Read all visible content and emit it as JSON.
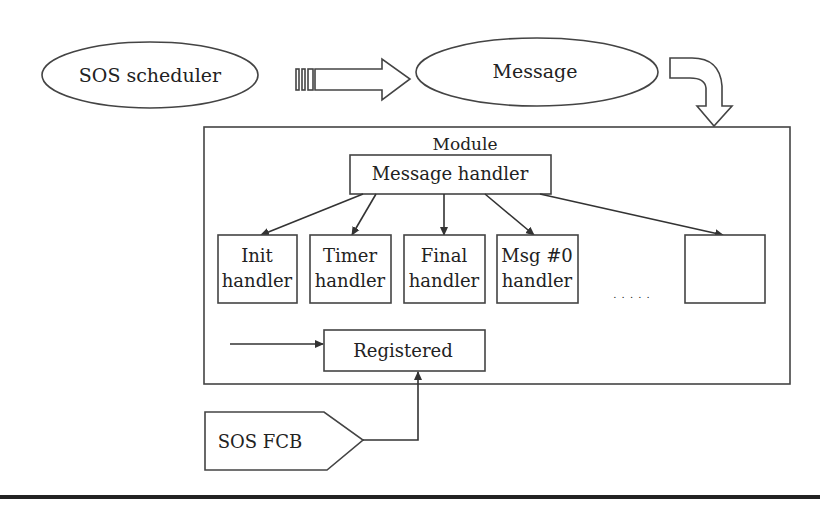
{
  "diagram": {
    "nodes": {
      "sos_scheduler": "SOS scheduler",
      "message": "Message",
      "module": "Module",
      "message_handler": "Message handler",
      "handlers": [
        {
          "line1": "Init",
          "line2": "handler"
        },
        {
          "line1": "Timer",
          "line2": "handler"
        },
        {
          "line1": "Final",
          "line2": "handler"
        },
        {
          "line1": "Msg #0",
          "line2": "handler"
        },
        {
          "line1": "",
          "line2": ""
        }
      ],
      "ellipsis": ". . . . .",
      "registered": "Registered",
      "sos_fcb": "SOS FCB"
    },
    "edges": [
      {
        "from": "sos_scheduler",
        "to": "message",
        "style": "block-arrow"
      },
      {
        "from": "message",
        "to": "module",
        "style": "curved-block-arrow"
      },
      {
        "from": "message_handler",
        "to": "Init handler"
      },
      {
        "from": "message_handler",
        "to": "Timer handler"
      },
      {
        "from": "message_handler",
        "to": "Final handler"
      },
      {
        "from": "message_handler",
        "to": "Msg #0 handler"
      },
      {
        "from": "message_handler",
        "to": "unnamed handler"
      },
      {
        "from": "external",
        "to": "registered"
      },
      {
        "from": "sos_fcb",
        "to": "registered"
      }
    ]
  }
}
